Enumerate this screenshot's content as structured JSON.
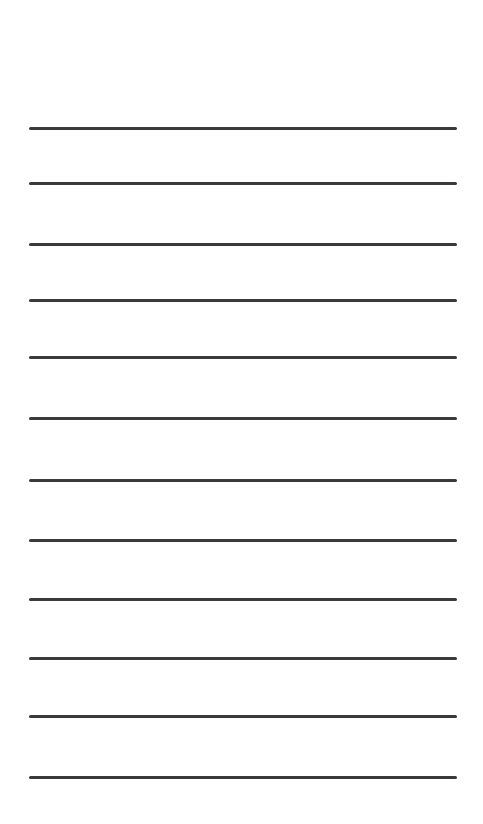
{
  "page": {
    "type": "lined-sheet",
    "background_color": "#ffffff",
    "rule_color": "#3a3a3a",
    "rule_count": 12,
    "rules": [
      {
        "y": 127
      },
      {
        "y": 182
      },
      {
        "y": 243
      },
      {
        "y": 299
      },
      {
        "y": 356
      },
      {
        "y": 417
      },
      {
        "y": 479
      },
      {
        "y": 539
      },
      {
        "y": 598
      },
      {
        "y": 657
      },
      {
        "y": 715
      },
      {
        "y": 776
      }
    ]
  }
}
